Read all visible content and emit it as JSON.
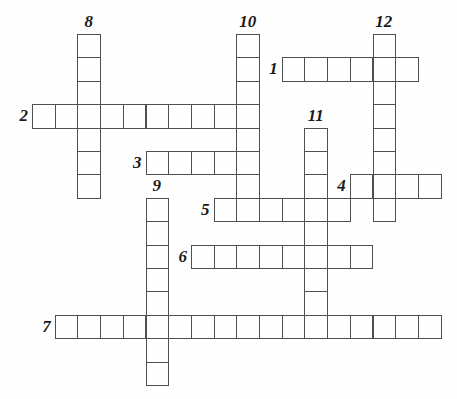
{
  "puzzle": {
    "kind": "crossword-grid",
    "background": "#fefefe",
    "line_color": "#4f4f4f",
    "number_color": "#1a1a1a",
    "grid": {
      "origin_x": 32,
      "origin_y": 34,
      "cell_w": 22.7,
      "cell_h": 23.4,
      "cols": 18,
      "rows": 15
    },
    "words": [
      {
        "number": "1",
        "direction": "across",
        "col": 11,
        "row": 1,
        "length": 6
      },
      {
        "number": "2",
        "direction": "across",
        "col": 0,
        "row": 3,
        "length": 10
      },
      {
        "number": "3",
        "direction": "across",
        "col": 5,
        "row": 5,
        "length": 5
      },
      {
        "number": "4",
        "direction": "across",
        "col": 14,
        "row": 6,
        "length": 4
      },
      {
        "number": "5",
        "direction": "across",
        "col": 8,
        "row": 7,
        "length": 6
      },
      {
        "number": "6",
        "direction": "across",
        "col": 7,
        "row": 9,
        "length": 8
      },
      {
        "number": "7",
        "direction": "across",
        "col": 1,
        "row": 12,
        "length": 17
      },
      {
        "number": "8",
        "direction": "down",
        "col": 2,
        "row": 0,
        "length": 7
      },
      {
        "number": "9",
        "direction": "down",
        "col": 5,
        "row": 7,
        "length": 8
      },
      {
        "number": "10",
        "direction": "down",
        "col": 9,
        "row": 0,
        "length": 8
      },
      {
        "number": "11",
        "direction": "down",
        "col": 12,
        "row": 4,
        "length": 9
      },
      {
        "number": "12",
        "direction": "down",
        "col": 15,
        "row": 0,
        "length": 8
      }
    ]
  }
}
